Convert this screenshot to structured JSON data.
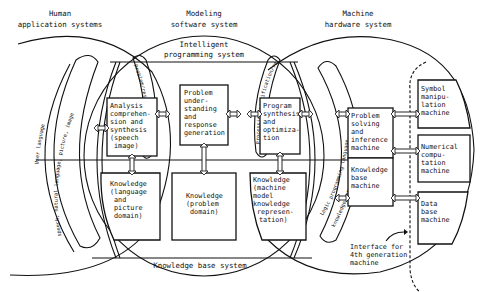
{
  "diagram": {
    "systems": {
      "human": {
        "line1": "Human",
        "line2": "application systems"
      },
      "modeling": {
        "line1": "Modeling",
        "line2": "software system"
      },
      "machine": {
        "line1": "Machine",
        "line2": "hardware system"
      }
    },
    "subsystems": {
      "intelligent_programming": {
        "line1": "Intelligent",
        "line2": "programming system"
      },
      "knowledge_base": "Knowledge base system"
    },
    "interfaces": {
      "user_language": {
        "line1": "User language",
        "line2": "speech, natural language, picture, image"
      },
      "intermediate": "Problem/response/intermediate",
      "processing": "Processing specification/result",
      "logic_language": {
        "line1": "Logic programming language,",
        "line2": "knowledge representation language"
      }
    },
    "boxes": {
      "analysis": [
        "Analysis",
        "comprehen-",
        "sion and",
        "synthesis",
        "(speech",
        "image)"
      ],
      "knowledge_language": [
        "Knowledge",
        "(language",
        "and",
        "picture",
        "domain)"
      ],
      "problem_understanding": [
        "Problem",
        "under-",
        "standing",
        "and",
        "response",
        "generation"
      ],
      "knowledge_problem": [
        "Knowledge",
        "(problem",
        "domain)"
      ],
      "program_synthesis": [
        "Program",
        "synthesis",
        "and",
        "optimiza-",
        "tion"
      ],
      "knowledge_machine": [
        "Knowledge",
        "(machine",
        "model",
        "knowledge",
        "represen-",
        "tation)"
      ],
      "problem_solving": [
        "Problem",
        "solving",
        "and",
        "inference",
        "machine"
      ],
      "knowledge_base_machine": [
        "Knowledge",
        "base",
        "machine"
      ],
      "symbol_manipulation": [
        "Symbol",
        "manipu-",
        "lation",
        "machine"
      ],
      "numerical_computation": [
        "Numerical",
        "compu-",
        "tation",
        "machine"
      ],
      "database": [
        "Data",
        "base",
        "machine"
      ]
    },
    "annotation": {
      "line1": "Interface for",
      "line2": "4th generation",
      "line3": "machine"
    }
  }
}
